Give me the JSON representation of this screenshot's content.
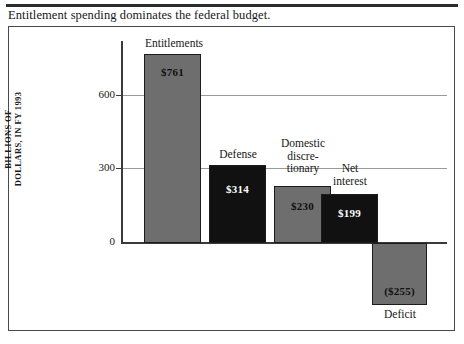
{
  "caption": "Entitlement spending dominates the federal budget.",
  "chart_data": {
    "type": "bar",
    "title": "Entitlement spending dominates the federal budget.",
    "xlabel": "",
    "ylabel": "BILLIONS OF DOLLARS, IN FY 1993",
    "ylabel_lines": [
      "BILLIONS OF",
      "DOLLARS, IN FY 1993"
    ],
    "ylim": [
      -300,
      800
    ],
    "yticks": [
      0,
      300,
      600
    ],
    "ytick_labels": [
      "0",
      "300",
      "600"
    ],
    "gridlines": true,
    "legend": "none",
    "categories": [
      "Entitlements",
      "Defense",
      "Domestic discretionary",
      "Net interest",
      "Deficit"
    ],
    "values": [
      761,
      314,
      230,
      199,
      -255
    ],
    "value_labels": [
      "$761",
      "$314",
      "$230",
      "$199",
      "($255)"
    ],
    "colors": [
      "#6e6e6e",
      "#111111",
      "#6e6e6e",
      "#111111",
      "#6e6e6e"
    ],
    "bars": [
      {
        "key": "entitlements",
        "label_lines": [
          "Entitlements"
        ],
        "value": 761,
        "value_label": "$761",
        "color": "gray"
      },
      {
        "key": "defense",
        "label_lines": [
          "Defense"
        ],
        "value": 314,
        "value_label": "$314",
        "color": "black"
      },
      {
        "key": "domestic",
        "label_lines": [
          "Domestic",
          "discre-",
          "tionary"
        ],
        "value": 230,
        "value_label": "$230",
        "color": "gray"
      },
      {
        "key": "netinterest",
        "label_lines": [
          "Net",
          "interest"
        ],
        "value": 199,
        "value_label": "$199",
        "color": "black"
      },
      {
        "key": "deficit",
        "label_lines": [
          "Deficit"
        ],
        "value": -255,
        "value_label": "($255)",
        "color": "gray"
      }
    ]
  },
  "labels": {
    "entitlements": "Entitlements",
    "defense": "Defense",
    "domestic_l1": "Domestic",
    "domestic_l2": "discre-",
    "domestic_l3": "tionary",
    "netinterest_l1": "Net",
    "netinterest_l2": "interest",
    "deficit": "Deficit"
  },
  "values": {
    "entitlements": "$761",
    "defense": "$314",
    "domestic": "$230",
    "netinterest": "$199",
    "deficit": "($255)"
  },
  "axis": {
    "y_label_line1": "BILLIONS OF",
    "y_label_line2": "DOLLARS, IN FY 1993",
    "tick_600": "600",
    "tick_300": "300",
    "tick_0": "0"
  }
}
